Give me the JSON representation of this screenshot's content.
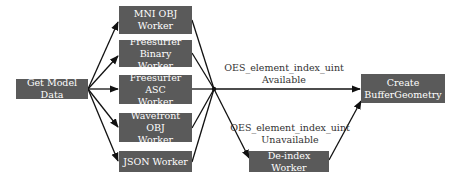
{
  "diagram": {
    "colors": {
      "node_fill": "#5a5a5a",
      "node_text": "#ffffff",
      "edge": "#111111",
      "label_text": "#333333"
    },
    "nodes": {
      "get_model_data": "Get Model Data",
      "mni_obj": "MNI OBJ\nWorker",
      "freesurfer_binary": "Freesurfer\nBinary Worker",
      "freesurfer_asc": "Freesurfer ASC\nWorker",
      "wavefront_obj": "Wavefront OBJ\nWorker",
      "json": "JSON Worker",
      "deindex": "De-index Worker",
      "create_buffer": "Create\nBufferGeometry"
    },
    "edge_labels": {
      "available": "OES_element_index_uint\nAvailable",
      "unavailable": "OES_element_index_uint\nUnavailable"
    }
  }
}
